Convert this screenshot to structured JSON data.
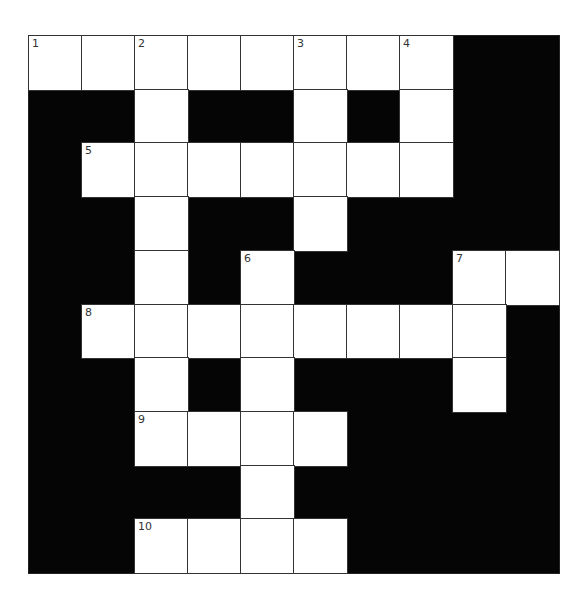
{
  "puzzle": {
    "rows": 10,
    "cols": 10,
    "colors": {
      "white": "#ffffff",
      "black": "#050505",
      "line": "#333333"
    },
    "white_cells": [
      [
        0,
        0
      ],
      [
        0,
        1
      ],
      [
        0,
        2
      ],
      [
        0,
        3
      ],
      [
        0,
        4
      ],
      [
        0,
        5
      ],
      [
        0,
        6
      ],
      [
        0,
        7
      ],
      [
        1,
        2
      ],
      [
        1,
        5
      ],
      [
        1,
        7
      ],
      [
        2,
        1
      ],
      [
        2,
        2
      ],
      [
        2,
        3
      ],
      [
        2,
        4
      ],
      [
        2,
        5
      ],
      [
        2,
        6
      ],
      [
        2,
        7
      ],
      [
        3,
        2
      ],
      [
        3,
        5
      ],
      [
        4,
        2
      ],
      [
        4,
        4
      ],
      [
        4,
        8
      ],
      [
        4,
        9
      ],
      [
        5,
        1
      ],
      [
        5,
        2
      ],
      [
        5,
        3
      ],
      [
        5,
        4
      ],
      [
        5,
        5
      ],
      [
        5,
        6
      ],
      [
        5,
        7
      ],
      [
        5,
        8
      ],
      [
        6,
        2
      ],
      [
        6,
        4
      ],
      [
        6,
        8
      ],
      [
        7,
        2
      ],
      [
        7,
        3
      ],
      [
        7,
        4
      ],
      [
        7,
        5
      ],
      [
        8,
        4
      ],
      [
        9,
        2
      ],
      [
        9,
        3
      ],
      [
        9,
        4
      ],
      [
        9,
        5
      ]
    ],
    "numbers": [
      {
        "label": "1",
        "row": 0,
        "col": 0
      },
      {
        "label": "2",
        "row": 0,
        "col": 2
      },
      {
        "label": "3",
        "row": 0,
        "col": 5
      },
      {
        "label": "4",
        "row": 0,
        "col": 7
      },
      {
        "label": "5",
        "row": 2,
        "col": 1
      },
      {
        "label": "6",
        "row": 4,
        "col": 4
      },
      {
        "label": "7",
        "row": 4,
        "col": 8
      },
      {
        "label": "8",
        "row": 5,
        "col": 1
      },
      {
        "label": "9",
        "row": 7,
        "col": 2
      },
      {
        "label": "10",
        "row": 9,
        "col": 2
      }
    ]
  }
}
